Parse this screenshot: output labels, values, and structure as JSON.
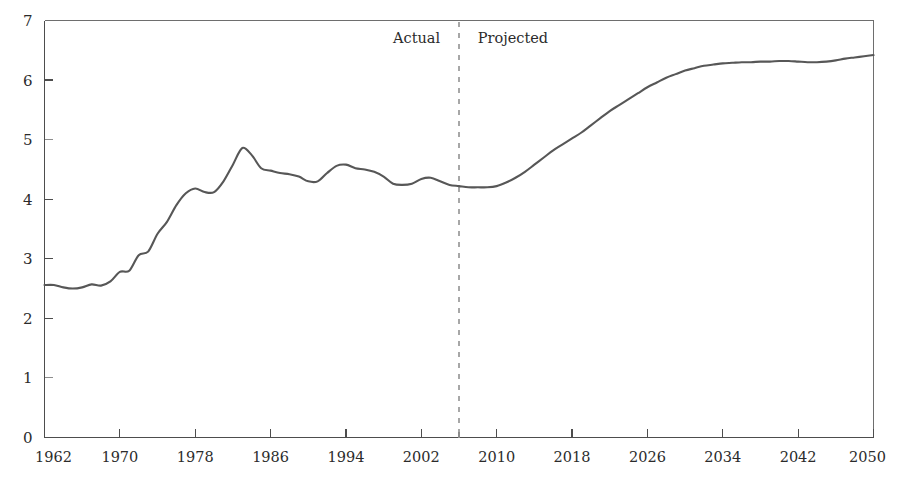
{
  "chart_data": {
    "type": "line",
    "title": "",
    "xlabel": "",
    "ylabel": "",
    "xlim": [
      1962,
      2050
    ],
    "ylim": [
      0,
      7
    ],
    "grid": false,
    "legend_position": "none",
    "y_ticks": [
      0,
      1,
      2,
      3,
      4,
      5,
      6,
      7
    ],
    "y_tick_labels": [
      "0",
      "1",
      "2",
      "3",
      "4",
      "5",
      "6",
      "7"
    ],
    "x_ticks": [
      1962,
      1970,
      1978,
      1986,
      1994,
      2002,
      2010,
      2018,
      2026,
      2034,
      2042,
      2050
    ],
    "x_tick_labels": [
      "1962",
      "1970",
      "1978",
      "1986",
      "1994",
      "2002",
      "2010",
      "2018",
      "2026",
      "2034",
      "2042",
      "2050"
    ],
    "annotations": [
      {
        "name": "actual-label",
        "text": "Actual",
        "x": 2004,
        "y": 6.62
      },
      {
        "name": "projected-label",
        "text": "Projected",
        "x": 2008,
        "y": 6.62
      }
    ],
    "divider": {
      "name": "actual-projected-divider",
      "x": 2006,
      "style": "dashed",
      "color": "#8a8a8a"
    },
    "series": [
      {
        "name": "value",
        "color": "#575757",
        "x": [
          1962,
          1963,
          1964,
          1965,
          1966,
          1967,
          1968,
          1969,
          1970,
          1971,
          1972,
          1973,
          1974,
          1975,
          1976,
          1977,
          1978,
          1979,
          1980,
          1981,
          1982,
          1983,
          1984,
          1985,
          1986,
          1987,
          1988,
          1989,
          1990,
          1991,
          1992,
          1993,
          1994,
          1995,
          1996,
          1997,
          1998,
          1999,
          2000,
          2001,
          2002,
          2003,
          2004,
          2005,
          2006,
          2007,
          2008,
          2009,
          2010,
          2011,
          2012,
          2013,
          2014,
          2015,
          2016,
          2017,
          2018,
          2019,
          2020,
          2021,
          2022,
          2023,
          2024,
          2025,
          2026,
          2027,
          2028,
          2029,
          2030,
          2031,
          2032,
          2033,
          2034,
          2035,
          2036,
          2037,
          2038,
          2039,
          2040,
          2041,
          2042,
          2043,
          2044,
          2045,
          2046,
          2047,
          2048,
          2049,
          2050
        ],
        "values": [
          2.56,
          2.56,
          2.52,
          2.5,
          2.52,
          2.57,
          2.55,
          2.62,
          2.78,
          2.8,
          3.06,
          3.12,
          3.42,
          3.62,
          3.9,
          4.1,
          4.18,
          4.12,
          4.12,
          4.3,
          4.58,
          4.86,
          4.74,
          4.52,
          4.48,
          4.44,
          4.42,
          4.38,
          4.3,
          4.3,
          4.44,
          4.56,
          4.58,
          4.52,
          4.5,
          4.46,
          4.38,
          4.26,
          4.24,
          4.26,
          4.34,
          4.36,
          4.3,
          4.24,
          4.22,
          4.2,
          4.2,
          4.2,
          4.22,
          4.28,
          4.36,
          4.46,
          4.58,
          4.7,
          4.82,
          4.92,
          5.02,
          5.12,
          5.24,
          5.36,
          5.48,
          5.58,
          5.68,
          5.78,
          5.88,
          5.96,
          6.04,
          6.1,
          6.16,
          6.2,
          6.24,
          6.26,
          6.28,
          6.29,
          6.3,
          6.3,
          6.31,
          6.31,
          6.32,
          6.32,
          6.31,
          6.3,
          6.3,
          6.31,
          6.33,
          6.36,
          6.38,
          6.4,
          6.42
        ]
      }
    ]
  },
  "axes": {
    "y_axis_name": "y-axis",
    "x_axis_name": "x-axis"
  }
}
